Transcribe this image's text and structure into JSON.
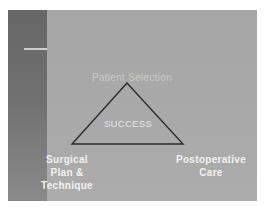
{
  "slide": {
    "colors": {
      "background": "#a8a8a8",
      "left_band": "#6a6a6a",
      "accent_line": "#cfcfcf",
      "triangle_stroke": "#2b2b2b",
      "label_text": "#f2f2f2"
    }
  },
  "diagram": {
    "shape": "triangle",
    "center_label": "SUCCESS",
    "vertices": {
      "top": "Patient Selection",
      "bottom_left_lines": [
        "Surgical",
        "Plan &",
        "Technique"
      ],
      "bottom_right_lines": [
        "Postoperative",
        "Care"
      ]
    }
  }
}
